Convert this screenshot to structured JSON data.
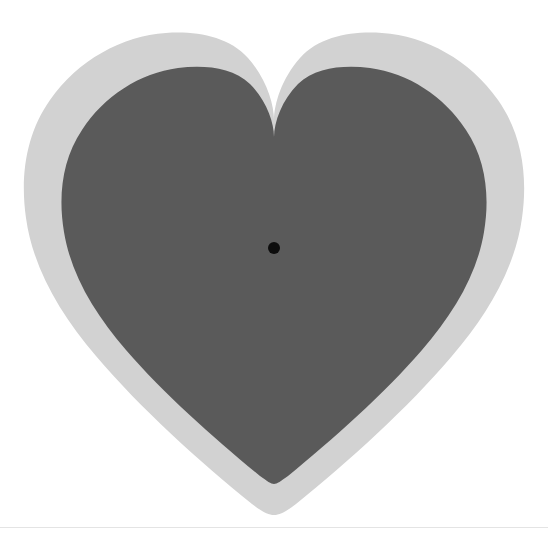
{
  "figure": {
    "title": "",
    "canvas": {
      "width": 548,
      "height": 536,
      "background_color": "#ffffff"
    },
    "shapes": {
      "outer_heart": {
        "name": "outer-heart-outline",
        "fill_color": "#d2d2d2",
        "bounds": {
          "left": 22,
          "top": 33,
          "right": 523,
          "bottom": 515
        },
        "notch_bottom_y": 120,
        "bottom_point": {
          "x": 274,
          "y": 515
        }
      },
      "inner_heart": {
        "name": "inner-heart-fill",
        "fill_color": "#5a5a5a",
        "bounds": {
          "left": 62,
          "top": 68,
          "right": 485,
          "bottom": 470
        },
        "notch_bottom_y": 137,
        "bottom_point": {
          "x": 274,
          "y": 470
        }
      },
      "center_dot": {
        "name": "center-marker-dot",
        "fill_color": "#0d0d0d",
        "center": {
          "x": 274,
          "y": 248
        },
        "radius": 6
      }
    },
    "divider": {
      "color": "#e4e4e4",
      "y": 527
    },
    "watermarks": {
      "top_text": "",
      "bottom_text": "",
      "color": "#fcfcfc"
    }
  },
  "chart_data": {
    "type": "scatter",
    "title": "",
    "xlabel": "",
    "ylabel": "",
    "xlim": [
      0,
      548
    ],
    "ylim": [
      536,
      0
    ],
    "grid": false,
    "legend": null,
    "annotations": [
      {
        "label": "center point",
        "x": 274,
        "y": 248,
        "color": "#0d0d0d",
        "marker": "circle",
        "size": 12
      }
    ],
    "series": [
      {
        "name": "outer heart outline",
        "type": "polygon",
        "color": "#d2d2d2",
        "values": [
          501,
          482
        ]
      },
      {
        "name": "inner heart fill",
        "type": "polygon",
        "color": "#5a5a5a",
        "values": [
          423,
          402
        ]
      }
    ]
  }
}
